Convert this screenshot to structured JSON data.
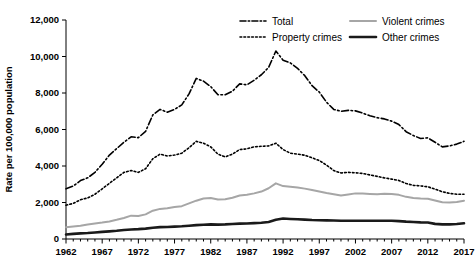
{
  "chart_data": {
    "type": "line",
    "title": "",
    "xlabel": "",
    "ylabel": "Rate per 100,000 population",
    "xlim": [
      1962,
      2017
    ],
    "ylim": [
      0,
      12000
    ],
    "grid": false,
    "legend_position": "top",
    "x_tick_labels": [
      "1962",
      "1967",
      "1972",
      "1977",
      "1982",
      "1987",
      "1992",
      "1997",
      "2002",
      "2007",
      "2012",
      "2017"
    ],
    "y_tick_labels": [
      "0",
      "2,000",
      "4,000",
      "6,000",
      "8,000",
      "10,000",
      "12,000"
    ],
    "y_ticks": [
      0,
      2000,
      4000,
      6000,
      8000,
      10000,
      12000
    ],
    "x_ticks": [
      1962,
      1967,
      1972,
      1977,
      1982,
      1987,
      1992,
      1997,
      2002,
      2007,
      2012,
      2017
    ],
    "x": [
      1962,
      1963,
      1964,
      1965,
      1966,
      1967,
      1968,
      1969,
      1970,
      1971,
      1972,
      1973,
      1974,
      1975,
      1976,
      1977,
      1978,
      1979,
      1980,
      1981,
      1982,
      1983,
      1984,
      1985,
      1986,
      1987,
      1988,
      1989,
      1990,
      1991,
      1992,
      1993,
      1994,
      1995,
      1996,
      1997,
      1998,
      1999,
      2000,
      2001,
      2002,
      2003,
      2004,
      2005,
      2006,
      2007,
      2008,
      2009,
      2010,
      2011,
      2012,
      2013,
      2014,
      2015,
      2016,
      2017
    ],
    "series": [
      {
        "name": "Total",
        "style": "dashdot",
        "color": "#000000",
        "width": 1.6,
        "dasharray": "7,2.5,1.6,2.5",
        "values": [
          2750,
          2900,
          3200,
          3350,
          3650,
          4100,
          4600,
          4950,
          5300,
          5600,
          5550,
          5900,
          6800,
          7100,
          6950,
          7100,
          7350,
          7950,
          8800,
          8650,
          8350,
          7900,
          7900,
          8100,
          8500,
          8450,
          8700,
          9000,
          9400,
          10300,
          9800,
          9650,
          9350,
          8950,
          8400,
          8050,
          7500,
          7100,
          7000,
          7050,
          7020,
          6900,
          6750,
          6650,
          6580,
          6460,
          6270,
          5880,
          5670,
          5510,
          5540,
          5300,
          5050,
          5100,
          5200,
          5350
        ]
      },
      {
        "name": "Property crimes",
        "style": "dotted",
        "color": "#000000",
        "width": 1.6,
        "dasharray": "1.7,2.2",
        "values": [
          1850,
          1950,
          2150,
          2250,
          2450,
          2750,
          3050,
          3350,
          3650,
          3750,
          3650,
          3850,
          4400,
          4650,
          4550,
          4600,
          4700,
          5000,
          5350,
          5250,
          5050,
          4650,
          4500,
          4650,
          4900,
          4940,
          5050,
          5080,
          5100,
          5250,
          4900,
          4700,
          4650,
          4590,
          4450,
          4300,
          4050,
          3750,
          3620,
          3650,
          3630,
          3590,
          3510,
          3430,
          3350,
          3280,
          3210,
          3040,
          2940,
          2910,
          2860,
          2730,
          2590,
          2500,
          2450,
          2450
        ]
      },
      {
        "name": "Violent crimes",
        "style": "solid",
        "color": "#a6a6a6",
        "width": 2.0,
        "dasharray": "",
        "values": [
          650,
          690,
          730,
          800,
          850,
          900,
          960,
          1050,
          1150,
          1280,
          1260,
          1350,
          1550,
          1650,
          1680,
          1750,
          1800,
          1950,
          2100,
          2220,
          2250,
          2160,
          2180,
          2260,
          2380,
          2420,
          2500,
          2600,
          2780,
          3050,
          2900,
          2860,
          2820,
          2760,
          2680,
          2600,
          2520,
          2450,
          2380,
          2440,
          2500,
          2490,
          2470,
          2450,
          2480,
          2470,
          2420,
          2310,
          2250,
          2220,
          2200,
          2110,
          2010,
          2000,
          2030,
          2100
        ]
      },
      {
        "name": "Other crimes",
        "style": "solid",
        "color": "#1a1a1a",
        "width": 2.6,
        "dasharray": "",
        "values": [
          250,
          280,
          310,
          330,
          360,
          390,
          420,
          450,
          490,
          520,
          540,
          570,
          620,
          650,
          660,
          680,
          700,
          730,
          760,
          780,
          800,
          790,
          800,
          820,
          840,
          850,
          870,
          890,
          930,
          1050,
          1120,
          1100,
          1080,
          1060,
          1040,
          1030,
          1020,
          1010,
          1000,
          1000,
          1000,
          1000,
          1000,
          1000,
          1000,
          1000,
          980,
          950,
          930,
          910,
          900,
          830,
          800,
          800,
          820,
          860
        ]
      }
    ],
    "legend": [
      {
        "label": "Total",
        "style": "dashdot",
        "color": "#000000",
        "width": 1.6,
        "dasharray": "6,2.2,1.5,2.2",
        "col": 0,
        "row": 0
      },
      {
        "label": "Property crimes",
        "style": "dotted",
        "color": "#000000",
        "width": 1.6,
        "dasharray": "1.7,2.2",
        "col": 0,
        "row": 1
      },
      {
        "label": "Violent crimes",
        "style": "solid",
        "color": "#a6a6a6",
        "width": 2.0,
        "dasharray": "",
        "col": 1,
        "row": 0
      },
      {
        "label": "Other crimes",
        "style": "solid",
        "color": "#1a1a1a",
        "width": 2.6,
        "dasharray": "",
        "col": 1,
        "row": 1
      }
    ]
  }
}
